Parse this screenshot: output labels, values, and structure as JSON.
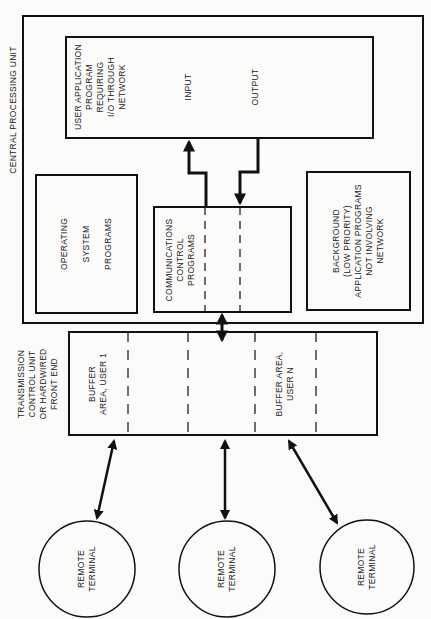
{
  "diagram": {
    "cpu": {
      "label": "CENTRAL PROCESSING UNIT"
    },
    "user_app": {
      "label": "USER APPLICATION\nPROGRAM\nREQUIRING\nI/O THROUGH\nNETWORK",
      "input_label": "INPUT",
      "output_label": "OUTPUT"
    },
    "os": {
      "label": "OPERATING\n\nSYSTEM\n\nPROGRAMS"
    },
    "comm": {
      "label": "COMMUNICATIONS\nCONTROL\nPROGRAMS"
    },
    "background": {
      "label": "BACKGROUND\n(LOW PRIORITY)\nAPPLICATION PROGRAMS\nNOT INVOLVING\nNETWORK"
    },
    "front_end": {
      "label": "TRANSMISSION\nCONTROL UNIT\nOR HARDWIRED\nFRONT END",
      "buffer_1": "BUFFER\nAREA, USER 1",
      "buffer_n": "BUFFER AREA,\nUSER N"
    },
    "terminals": [
      {
        "label": "REMOTE\nTERMINAL"
      },
      {
        "label": "REMOTE\nTERMINAL"
      },
      {
        "label": "REMOTE\nTERMINAL"
      }
    ]
  }
}
